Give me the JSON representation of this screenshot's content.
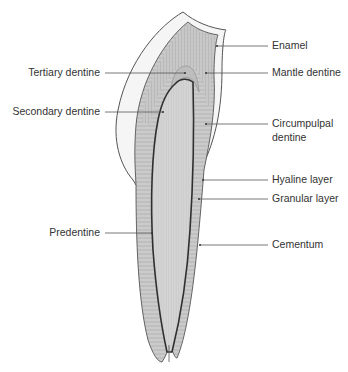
{
  "figure": {
    "colors": {
      "enamel": "#f4f4f4",
      "dentine": "#c9c9c9",
      "pulp": "#d6d6d6",
      "outline": "#444444",
      "leader_line": "#555555",
      "text": "#333333"
    }
  },
  "labels": {
    "enamel": "Enamel",
    "tertiary_dentine": "Tertiary dentine",
    "mantle_dentine": "Mantle dentine",
    "secondary_dentine": "Secondary dentine",
    "circumpulpal_dentine_line1": "Circumpulpal",
    "circumpulpal_dentine_line2": "dentine",
    "hyaline_layer": "Hyaline layer",
    "granular_layer": "Granular layer",
    "predentine": "Predentine",
    "cementum": "Cementum"
  }
}
